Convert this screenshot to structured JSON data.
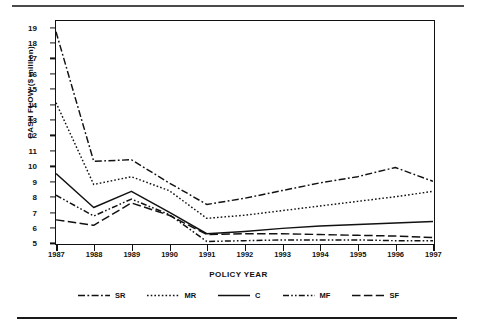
{
  "chart_data": {
    "type": "line",
    "title": "",
    "xlabel": "POLICY YEAR",
    "ylabel": "CASH FLOW ($ million)",
    "categories": [
      "1987",
      "1988",
      "1989",
      "1990",
      "1991",
      "1992",
      "1993",
      "1994",
      "1995",
      "1996",
      "1997"
    ],
    "x": [
      1987,
      1988,
      1989,
      1990,
      1991,
      1992,
      1993,
      1994,
      1995,
      1996,
      1997
    ],
    "ylim": [
      5,
      19.4
    ],
    "xlim": [
      1987,
      1997
    ],
    "yticks": [
      5,
      6,
      7,
      8,
      9,
      10,
      11,
      12,
      13,
      14,
      15,
      16,
      17,
      18,
      19
    ],
    "grid": false,
    "legend_position": "bottom",
    "series": [
      {
        "name": "SR",
        "style": "dash-dot",
        "values": [
          18.7,
          10.3,
          10.4,
          8.9,
          7.5,
          7.9,
          8.4,
          8.9,
          9.3,
          9.9,
          9.0
        ]
      },
      {
        "name": "MR",
        "style": "dotted",
        "values": [
          14.1,
          8.8,
          9.3,
          8.4,
          6.6,
          6.8,
          7.1,
          7.4,
          7.7,
          8.0,
          8.35
        ]
      },
      {
        "name": "C",
        "style": "solid",
        "values": [
          9.5,
          7.3,
          8.35,
          7.0,
          5.6,
          5.75,
          5.95,
          6.1,
          6.2,
          6.3,
          6.4
        ]
      },
      {
        "name": "MF",
        "style": "dash-dot-dot",
        "values": [
          8.1,
          6.75,
          7.85,
          6.85,
          5.1,
          5.15,
          5.2,
          5.2,
          5.2,
          5.15,
          5.15
        ]
      },
      {
        "name": "SF",
        "style": "long-dash",
        "values": [
          6.5,
          6.15,
          7.6,
          6.8,
          5.55,
          5.6,
          5.6,
          5.55,
          5.5,
          5.45,
          5.35
        ]
      }
    ]
  },
  "legend": {
    "items": [
      {
        "label": "SR"
      },
      {
        "label": "MR"
      },
      {
        "label": "C"
      },
      {
        "label": "MF"
      },
      {
        "label": "SF"
      }
    ]
  }
}
